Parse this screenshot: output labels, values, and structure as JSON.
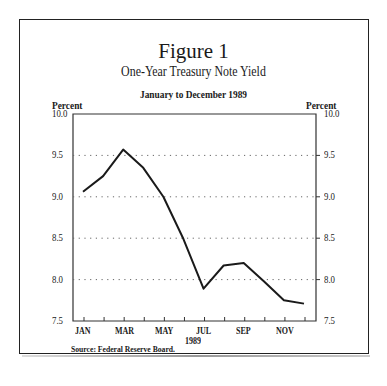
{
  "figure": {
    "title": "Figure 1",
    "subtitle": "One-Year Treasury Note Yield",
    "period": "January to December 1989",
    "left_axis_label": "Percent",
    "right_axis_label": "Percent",
    "year_label": "1989",
    "source": "Source: Federal Reserve Board."
  },
  "chart_data": {
    "type": "line",
    "title": "One-Year Treasury Note Yield",
    "subtitle": "January to December 1989",
    "xlabel": "1989",
    "ylabel": "Percent",
    "ylim": [
      7.5,
      10.0
    ],
    "yticks": [
      "10.0",
      "9.5",
      "9.0",
      "8.5",
      "8.0",
      "7.5"
    ],
    "x": [
      "JAN",
      "FEB",
      "MAR",
      "APR",
      "MAY",
      "JUN",
      "JUL",
      "AUG",
      "SEP",
      "OCT",
      "NOV",
      "DEC"
    ],
    "xtick_labels": [
      "JAN",
      "MAR",
      "MAY",
      "JUL",
      "SEP",
      "NOV"
    ],
    "series": [
      {
        "name": "One-Year Treasury Note Yield",
        "values": [
          9.06,
          9.25,
          9.57,
          9.35,
          9.0,
          8.49,
          7.89,
          8.17,
          8.2,
          7.98,
          7.75,
          7.71
        ]
      }
    ],
    "grid": "horizontal dotted at 8.0, 8.5, 9.0, 9.5",
    "legend": "none"
  }
}
